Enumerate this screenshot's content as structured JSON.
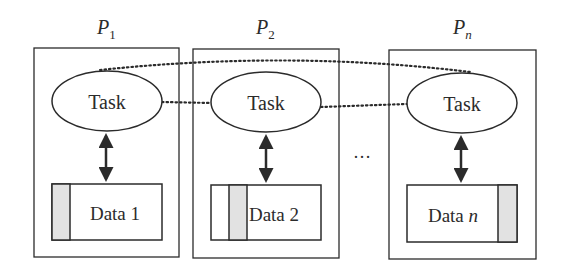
{
  "diagram": {
    "processors": [
      {
        "label": "P",
        "subscript": "1",
        "task": "Task",
        "data_label": "Data 1",
        "data_italic_suffix": ""
      },
      {
        "label": "P",
        "subscript": "2",
        "task": "Task",
        "data_label": "Data 2",
        "data_italic_suffix": ""
      },
      {
        "label": "P",
        "subscript": "n",
        "task": "Task",
        "data_label": "Data ",
        "data_italic_suffix": "n"
      }
    ],
    "ellipsis": "…",
    "colors": {
      "stroke": "#2b2b2b",
      "shade": "#e2e2e2",
      "background": "#ffffff"
    }
  }
}
